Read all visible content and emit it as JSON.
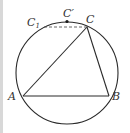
{
  "diagram": {
    "type": "geometry-circle-inscribed-triangle",
    "circle": {
      "cx": 67,
      "cy": 73,
      "r": 51
    },
    "points": {
      "A": {
        "label": "A",
        "x": 23,
        "y": 96
      },
      "B": {
        "label": "B",
        "x": 109,
        "y": 96
      },
      "C": {
        "label": "C",
        "x": 87,
        "y": 27
      },
      "C_prime": {
        "label": "C′",
        "x": 67,
        "y": 22
      },
      "C1": {
        "label": "C",
        "sub": "1",
        "x": 44,
        "y": 27
      }
    },
    "segments": [
      {
        "from": "A",
        "to": "B",
        "style": "solid"
      },
      {
        "from": "A",
        "to": "C",
        "style": "solid"
      },
      {
        "from": "B",
        "to": "C",
        "style": "solid"
      },
      {
        "from": "C1",
        "to": "C",
        "style": "dashed"
      }
    ],
    "colors": {
      "stroke": "#2a2a2a",
      "label": "#333333",
      "border": "#d8d8d8"
    }
  }
}
